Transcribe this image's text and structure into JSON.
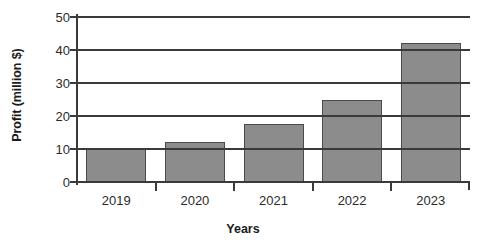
{
  "chart_data": {
    "type": "bar",
    "title": "",
    "xlabel": "Years",
    "ylabel": "Profit (million $)",
    "categories": [
      "2019",
      "2020",
      "2021",
      "2022",
      "2023"
    ],
    "values": [
      10,
      12,
      17.5,
      24.8,
      42
    ],
    "series": [
      {
        "name": "Profit",
        "values": [
          10,
          12,
          17.5,
          24.8,
          42
        ]
      }
    ],
    "ylim": [
      0,
      50
    ],
    "ytick_labels": [
      "0",
      "10",
      "20",
      "30",
      "40",
      "50"
    ],
    "yticks": [
      0,
      10,
      20,
      30,
      40,
      50
    ],
    "grid": true,
    "grid_axis": "y",
    "legend": false,
    "legend_position": "none",
    "bar_color": "#8c8c8c",
    "bar_border_color": "#4a4a4a",
    "axis_color": "#3a3a3a",
    "background_color": "#ffffff"
  }
}
